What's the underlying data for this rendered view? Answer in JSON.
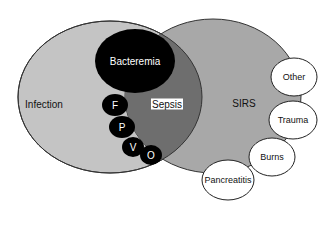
{
  "diagram": {
    "type": "venn",
    "colors": {
      "infection": "#c4c4c4",
      "sirs": "#a8a8a8",
      "sepsis_overlap": "#6e6e6e",
      "bacteremia": "#000000",
      "organ_dots": "#000000",
      "outline": "#333333"
    },
    "sets": {
      "infection": "Infection",
      "sirs": "SIRS",
      "sepsis": "Sepsis",
      "bacteremia": "Bacteremia"
    },
    "organ_markers": [
      "F",
      "P",
      "V",
      "O"
    ],
    "sirs_causes": [
      "Other",
      "Trauma",
      "Burns",
      "Pancreatitis"
    ]
  }
}
